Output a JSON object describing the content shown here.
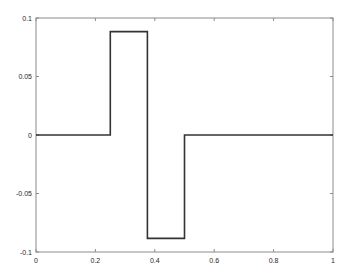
{
  "chart_data": {
    "type": "line",
    "title": "",
    "xlabel": "",
    "ylabel": "",
    "xlim": [
      0,
      1
    ],
    "ylim": [
      -0.1,
      0.1
    ],
    "grid": false,
    "legend": null,
    "x_ticks": [
      "0",
      "0.2",
      "0.4",
      "0.6",
      "0.8",
      "1"
    ],
    "y_ticks": [
      "-0.1",
      "-0.05",
      "0",
      "0.05",
      "0.1"
    ],
    "series": [
      {
        "name": "step",
        "color": "#333333",
        "x": [
          0,
          0.25,
          0.25,
          0.375,
          0.375,
          0.5,
          0.5,
          1
        ],
        "y": [
          0,
          0,
          0.0884,
          0.0884,
          -0.0884,
          -0.0884,
          0,
          0
        ]
      }
    ]
  }
}
